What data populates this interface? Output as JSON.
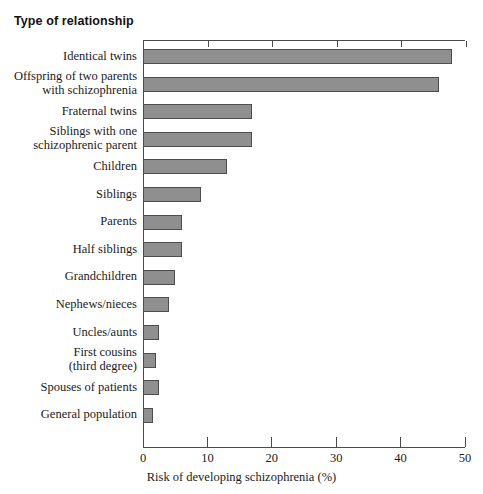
{
  "chart_data": {
    "type": "bar",
    "orientation": "horizontal",
    "title": "Type of relationship",
    "xlabel": "Risk of developing schizophrenia (%)",
    "ylabel": "Type of relationship",
    "xlim": [
      0,
      50
    ],
    "xticks": [
      0,
      10,
      20,
      30,
      40,
      50
    ],
    "xticklabels": [
      "0",
      "10",
      "20",
      "30",
      "40",
      "50"
    ],
    "grid": false,
    "legend": null,
    "bar_color": "#8f8f8f",
    "bar_edge_color": "#4d4d4d",
    "axis_color": "#4a4a4a",
    "background": "#ffffff",
    "categories": [
      "Identical twins",
      "Offspring of two parents\nwith schizophrenia",
      "Fraternal twins",
      "Siblings with one\nschizophrenic parent",
      "Children",
      "Siblings",
      "Parents",
      "Half siblings",
      "Grandchildren",
      "Nephews/nieces",
      "Uncles/aunts",
      "First cousins\n(third degree)",
      "Spouses of patients",
      "General population"
    ],
    "values": [
      48,
      46,
      17,
      17,
      13,
      9,
      6,
      6,
      5,
      4,
      2.5,
      2,
      2.5,
      1.5
    ]
  }
}
